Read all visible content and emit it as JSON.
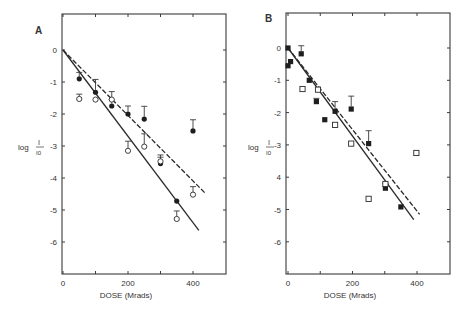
{
  "chart_data": [
    {
      "type": "scatter",
      "panel_label": "A",
      "title": "",
      "xlabel": "DOSE (Mrads)",
      "ylabel": "log I/I0",
      "ylabel_main": "log",
      "ylabel_num": "I",
      "ylabel_den": "I0",
      "xlim": [
        0,
        500
      ],
      "ylim": [
        -7,
        1
      ],
      "xticks": [
        0,
        200,
        400
      ],
      "xtick_minor": [
        100,
        300
      ],
      "yticks": [
        0,
        -1,
        -2,
        -3,
        -4,
        -5,
        -6
      ],
      "ytick_labels": [
        "0",
        "-1",
        "-2",
        "-3",
        "-4",
        "-5",
        "-6"
      ],
      "grid": false,
      "legend": null,
      "series": [
        {
          "name": "filled circles",
          "marker": "filled-circle",
          "x": [
            50,
            100,
            150,
            200,
            250,
            300,
            350,
            400
          ],
          "y": [
            -0.9,
            -1.32,
            -1.75,
            -2.0,
            -2.16,
            -3.55,
            -4.72,
            -2.53
          ],
          "err_up": [
            0.2,
            0.4,
            0.2,
            0.25,
            0.4,
            0.2,
            0,
            0.35
          ]
        },
        {
          "name": "open circles",
          "marker": "open-circle",
          "x": [
            50,
            100,
            150,
            200,
            250,
            300,
            350,
            400
          ],
          "y": [
            -1.53,
            -1.55,
            -1.55,
            -3.15,
            -3.02,
            -3.48,
            -5.28,
            -4.52
          ],
          "err_up": [
            0.15,
            0,
            0.25,
            0.3,
            0.4,
            0.2,
            0.25,
            0.25
          ]
        }
      ],
      "fit_lines": [
        {
          "name": "solid fit",
          "style": "solid",
          "x": [
            0,
            418
          ],
          "y": [
            0,
            -5.64
          ]
        },
        {
          "name": "dashed fit",
          "style": "dashed",
          "x": [
            0,
            438
          ],
          "y": [
            0,
            -4.48
          ]
        }
      ]
    },
    {
      "type": "scatter",
      "panel_label": "B",
      "title": "",
      "xlabel": "DOSE (Mrads)",
      "ylabel": "log I/I0",
      "ylabel_main": "log",
      "ylabel_num": "I",
      "ylabel_den": "I0",
      "xlim": [
        0,
        500
      ],
      "ylim": [
        -7,
        1
      ],
      "xticks": [
        0,
        200,
        400
      ],
      "xtick_minor": [
        100,
        300
      ],
      "yticks": [
        0,
        -1,
        -2,
        -3,
        -4,
        -5,
        -6
      ],
      "ytick_labels": [
        "0",
        "-1",
        "-2",
        "-3",
        "4",
        "-5",
        "-6"
      ],
      "grid": false,
      "legend": null,
      "series": [
        {
          "name": "filled squares",
          "marker": "filled-square",
          "x": [
            0,
            0,
            8,
            41,
            66,
            88,
            114,
            146,
            196,
            250,
            302,
            350
          ],
          "y": [
            0,
            -0.55,
            -0.42,
            -0.18,
            -1.0,
            -1.66,
            -2.22,
            -1.96,
            -1.89,
            -2.96,
            -4.34,
            -4.92
          ],
          "err_up": [
            0,
            0,
            0,
            0.25,
            0,
            0.1,
            0,
            0.3,
            0.4,
            0.4,
            0.15,
            0
          ]
        },
        {
          "name": "open squares",
          "marker": "open-square",
          "x": [
            45,
            93,
            146,
            196,
            250,
            302,
            398
          ],
          "y": [
            -1.27,
            -1.29,
            -2.38,
            -2.96,
            -4.67,
            -4.21,
            -3.25
          ],
          "err_up": [
            0,
            0,
            0,
            0,
            0,
            0,
            0
          ]
        }
      ],
      "fit_lines": [
        {
          "name": "solid fit",
          "style": "solid",
          "x": [
            0,
            390
          ],
          "y": [
            0,
            -5.31
          ]
        },
        {
          "name": "dashed fit",
          "style": "dashed",
          "x": [
            0,
            408
          ],
          "y": [
            0,
            -5.15
          ]
        }
      ]
    }
  ]
}
